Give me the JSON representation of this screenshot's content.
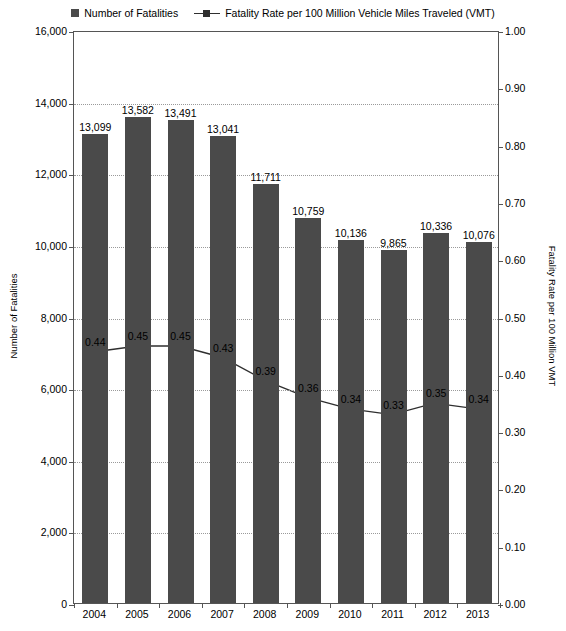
{
  "chart_data": {
    "type": "bar",
    "title": "",
    "subtitle": "",
    "xlabel": "",
    "ylabel": "Number of Fatalities",
    "y2label": "Fatality Rate per 100 Million VMT",
    "categories": [
      "2004",
      "2005",
      "2006",
      "2007",
      "2008",
      "2009",
      "2010",
      "2011",
      "2012",
      "2013"
    ],
    "series": [
      {
        "name": "Number of Fatalities",
        "type": "bar",
        "axis": "left",
        "color": "#4a4a4a",
        "values": [
          13099,
          13582,
          13491,
          13041,
          11711,
          10759,
          10136,
          9865,
          10336,
          10076
        ],
        "labels": [
          "13,099",
          "13,582",
          "13,491",
          "13,041",
          "11,711",
          "10,759",
          "10,136",
          "9,865",
          "10,336",
          "10,076"
        ]
      },
      {
        "name": "Fatality Rate per 100 Million Vehicle Miles Traveled (VMT)",
        "type": "line",
        "axis": "right",
        "color": "#2f2f2f",
        "values": [
          0.44,
          0.45,
          0.45,
          0.43,
          0.39,
          0.36,
          0.34,
          0.33,
          0.35,
          0.34
        ],
        "labels": [
          "0.44",
          "0.45",
          "0.45",
          "0.43",
          "0.39",
          "0.36",
          "0.34",
          "0.33",
          "0.35",
          "0.34"
        ]
      }
    ],
    "ylim": [
      0,
      16000
    ],
    "yticks": [
      0,
      2000,
      4000,
      6000,
      8000,
      10000,
      12000,
      14000,
      16000
    ],
    "ytick_labels": [
      "0",
      "2,000",
      "4,000",
      "6,000",
      "8,000",
      "10,000",
      "12,000",
      "14,000",
      "16,000"
    ],
    "y2lim": [
      0.0,
      1.0
    ],
    "y2ticks": [
      0.0,
      0.1,
      0.2,
      0.3,
      0.4,
      0.5,
      0.6,
      0.7,
      0.8,
      0.9,
      1.0
    ],
    "y2tick_labels": [
      "0.00",
      "0.10",
      "0.20",
      "0.30",
      "0.40",
      "0.50",
      "0.60",
      "0.70",
      "0.80",
      "0.90",
      "1.00"
    ],
    "grid": true,
    "legend_position": "top"
  },
  "legend": {
    "entries": [
      {
        "label": "Number of Fatalities",
        "marker": "square",
        "color": "#4a4a4a"
      },
      {
        "label": "Fatality Rate per 100 Million Vehicle Miles Traveled (VMT)",
        "marker": "line-square",
        "color": "#2f2f2f"
      }
    ]
  },
  "axes": {
    "left_title": "Number of Fatalities",
    "right_title": "Fatality Rate per 100 Million VMT"
  }
}
